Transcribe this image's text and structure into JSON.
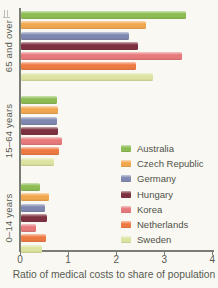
{
  "chart_data": {
    "type": "bar",
    "orientation": "horizontal",
    "title": "",
    "xlabel": "Ratio of medical costs to share of population",
    "ylabel": "",
    "xlim": [
      0,
      4
    ],
    "xticks": [
      "0",
      "1",
      "2",
      "3",
      "4"
    ],
    "grid": false,
    "legend_position": "right-middle",
    "categories": [
      "65 and over",
      "15–64 years",
      "0–14 years"
    ],
    "series": [
      {
        "name": "Australia",
        "color": "#8cbc52",
        "values": [
          3.45,
          0.75,
          0.4
        ]
      },
      {
        "name": "Czech Republic",
        "color": "#f1a74e",
        "values": [
          2.6,
          0.79,
          0.6
        ]
      },
      {
        "name": "Germany",
        "color": "#7e88b0",
        "values": [
          2.25,
          0.75,
          0.5
        ]
      },
      {
        "name": "Hungary",
        "color": "#7d3040",
        "values": [
          2.45,
          0.79,
          0.55
        ]
      },
      {
        "name": "Korea",
        "color": "#e6797c",
        "values": [
          3.35,
          0.86,
          0.33
        ]
      },
      {
        "name": "Netherlands",
        "color": "#ee7a43",
        "values": [
          2.4,
          0.81,
          0.53
        ]
      },
      {
        "name": "Sweden",
        "color": "#dde3a0",
        "values": [
          2.75,
          0.7,
          0.45
        ]
      }
    ]
  }
}
